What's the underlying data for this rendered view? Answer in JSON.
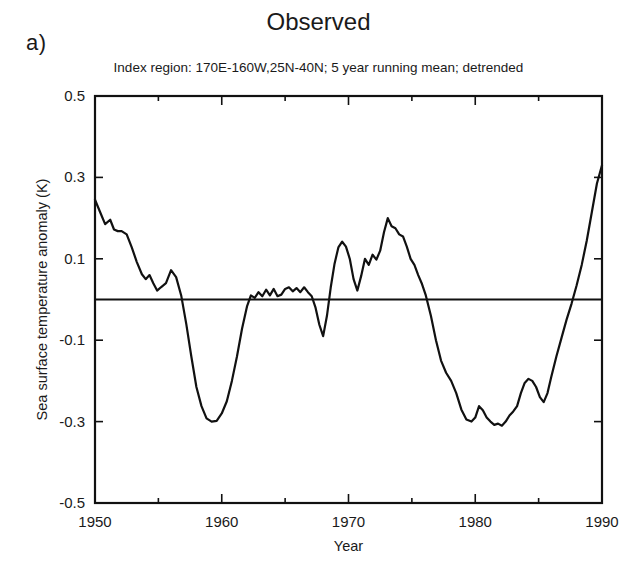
{
  "figure": {
    "panel_letter": "a)",
    "title": "Observed",
    "subtitle": "Index region: 170E-160W,25N-40N; 5 year running mean; detrended"
  },
  "chart_data": {
    "type": "line",
    "title": "Observed",
    "subtitle": "Index region: 170E-160W,25N-40N; 5 year running mean; detrended",
    "xlabel": "Year",
    "ylabel": "Sea surface temperature anomaly (K)",
    "xlim": [
      1950,
      1990
    ],
    "ylim": [
      -0.5,
      0.5
    ],
    "xticks": [
      1950,
      1960,
      1970,
      1980,
      1990
    ],
    "xtick_labels": [
      "1950",
      "1960",
      "1970",
      "1980",
      "1990"
    ],
    "xminor_ticks": [
      1955,
      1965,
      1975,
      1985
    ],
    "yticks": [
      -0.5,
      -0.3,
      -0.1,
      0.1,
      0.3,
      0.5
    ],
    "ytick_labels": [
      "-0.5",
      "-0.3",
      "-0.1",
      "0.1",
      "0.3",
      "0.5"
    ],
    "grid": false,
    "legend": false,
    "zero_line": 0,
    "series": [
      {
        "name": "Sea surface temperature anomaly",
        "color": "#111111",
        "x": [
          1950.0,
          1950.4,
          1950.8,
          1951.2,
          1951.5,
          1951.8,
          1952.1,
          1952.5,
          1952.9,
          1953.3,
          1953.7,
          1954.0,
          1954.3,
          1954.6,
          1954.9,
          1955.2,
          1955.6,
          1956.0,
          1956.4,
          1956.8,
          1957.2,
          1957.6,
          1958.0,
          1958.4,
          1958.8,
          1959.2,
          1959.6,
          1960.0,
          1960.4,
          1960.8,
          1961.2,
          1961.6,
          1962.0,
          1962.3,
          1962.6,
          1962.9,
          1963.2,
          1963.5,
          1963.8,
          1964.1,
          1964.4,
          1964.7,
          1965.0,
          1965.3,
          1965.6,
          1965.9,
          1966.2,
          1966.5,
          1966.8,
          1967.1,
          1967.4,
          1967.7,
          1968.0,
          1968.3,
          1968.6,
          1968.9,
          1969.2,
          1969.5,
          1969.8,
          1970.1,
          1970.4,
          1970.7,
          1971.0,
          1971.3,
          1971.6,
          1971.9,
          1972.2,
          1972.5,
          1972.8,
          1973.1,
          1973.4,
          1973.7,
          1974.0,
          1974.3,
          1974.6,
          1974.9,
          1975.2,
          1975.5,
          1975.8,
          1976.1,
          1976.5,
          1976.9,
          1977.3,
          1977.7,
          1978.1,
          1978.5,
          1978.9,
          1979.3,
          1979.7,
          1980.0,
          1980.3,
          1980.6,
          1980.9,
          1981.2,
          1981.5,
          1981.8,
          1982.1,
          1982.4,
          1982.7,
          1983.0,
          1983.3,
          1983.6,
          1983.9,
          1984.2,
          1984.5,
          1984.8,
          1985.1,
          1985.4,
          1985.7,
          1986.0,
          1986.4,
          1986.8,
          1987.2,
          1987.6,
          1988.0,
          1988.4,
          1988.8,
          1989.2,
          1989.6,
          1990.0
        ],
        "y": [
          0.245,
          0.215,
          0.185,
          0.196,
          0.172,
          0.168,
          0.168,
          0.16,
          0.128,
          0.092,
          0.062,
          0.05,
          0.06,
          0.04,
          0.022,
          0.03,
          0.04,
          0.072,
          0.055,
          0.01,
          -0.06,
          -0.14,
          -0.215,
          -0.262,
          -0.292,
          -0.3,
          -0.298,
          -0.28,
          -0.25,
          -0.2,
          -0.14,
          -0.072,
          -0.016,
          0.01,
          0.004,
          0.018,
          0.008,
          0.024,
          0.01,
          0.026,
          0.008,
          0.012,
          0.026,
          0.03,
          0.02,
          0.028,
          0.018,
          0.03,
          0.018,
          0.008,
          -0.02,
          -0.062,
          -0.09,
          -0.04,
          0.03,
          0.088,
          0.128,
          0.142,
          0.13,
          0.1,
          0.05,
          0.022,
          0.058,
          0.1,
          0.085,
          0.11,
          0.098,
          0.12,
          0.165,
          0.2,
          0.18,
          0.175,
          0.16,
          0.155,
          0.13,
          0.1,
          0.085,
          0.06,
          0.038,
          0.01,
          -0.04,
          -0.1,
          -0.15,
          -0.18,
          -0.2,
          -0.23,
          -0.27,
          -0.295,
          -0.3,
          -0.29,
          -0.262,
          -0.272,
          -0.29,
          -0.3,
          -0.308,
          -0.305,
          -0.31,
          -0.3,
          -0.285,
          -0.275,
          -0.262,
          -0.23,
          -0.205,
          -0.195,
          -0.2,
          -0.215,
          -0.24,
          -0.252,
          -0.23,
          -0.19,
          -0.14,
          -0.095,
          -0.05,
          -0.01,
          0.035,
          0.085,
          0.145,
          0.215,
          0.285,
          0.33
        ]
      }
    ]
  }
}
